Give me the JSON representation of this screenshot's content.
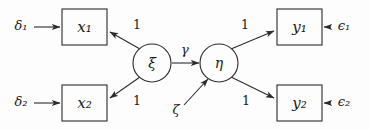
{
  "diagram": {
    "type": "structural-equation-model-path-diagram",
    "title": "",
    "background_color": "#fdfdfd",
    "stroke_color": "#2b2b2b",
    "text_color": "#1a1a1a"
  },
  "observed_variables": [
    {
      "id": "x1",
      "label": "x₁",
      "shape": "rectangle",
      "x": 62,
      "y": 9,
      "w": 45,
      "h": 36
    },
    {
      "id": "x2",
      "label": "x₂",
      "shape": "rectangle",
      "x": 62,
      "y": 85,
      "w": 45,
      "h": 36
    },
    {
      "id": "y1",
      "label": "y₁",
      "shape": "rectangle",
      "x": 277,
      "y": 9,
      "w": 45,
      "h": 36
    },
    {
      "id": "y2",
      "label": "y₂",
      "shape": "rectangle",
      "x": 277,
      "y": 85,
      "w": 45,
      "h": 36
    }
  ],
  "latent_variables": [
    {
      "id": "xi",
      "label": "ξ",
      "shape": "circle",
      "cx": 152,
      "cy": 63,
      "r": 19
    },
    {
      "id": "eta",
      "label": "η",
      "shape": "circle",
      "cx": 219,
      "cy": 63,
      "r": 19
    }
  ],
  "error_terms": [
    {
      "id": "delta1",
      "label": "δ₁",
      "x": 21,
      "y": 26
    },
    {
      "id": "delta2",
      "label": "δ₂",
      "x": 21,
      "y": 102
    },
    {
      "id": "epsilon1",
      "label": "ϵ₁",
      "x": 344,
      "y": 26
    },
    {
      "id": "epsilon2",
      "label": "ϵ₂",
      "x": 344,
      "y": 102
    },
    {
      "id": "zeta",
      "label": "ζ",
      "x": 176,
      "y": 110
    }
  ],
  "path_labels": [
    {
      "id": "loading-x1",
      "label": "1",
      "x": 137,
      "y": 25,
      "from": "xi",
      "to": "x1"
    },
    {
      "id": "loading-x2",
      "label": "1",
      "x": 137,
      "y": 101,
      "from": "xi",
      "to": "x2"
    },
    {
      "id": "loading-y1",
      "label": "1",
      "x": 245,
      "y": 25,
      "from": "eta",
      "to": "y1"
    },
    {
      "id": "loading-y2",
      "label": "1",
      "x": 246,
      "y": 101,
      "from": "eta",
      "to": "y2"
    },
    {
      "id": "structural-gamma",
      "label": "γ",
      "x": 185,
      "y": 50,
      "from": "xi",
      "to": "eta"
    }
  ],
  "edges": [
    {
      "id": "edge-delta1-x1",
      "from": "delta1",
      "to": "x1",
      "style": "straight-arrow"
    },
    {
      "id": "edge-delta2-x2",
      "from": "delta2",
      "to": "x2",
      "style": "straight-arrow"
    },
    {
      "id": "edge-xi-x1",
      "from": "xi",
      "to": "x1",
      "style": "diagonal-arrow",
      "coefficient": "1"
    },
    {
      "id": "edge-xi-x2",
      "from": "xi",
      "to": "x2",
      "style": "diagonal-arrow",
      "coefficient": "1"
    },
    {
      "id": "edge-xi-eta",
      "from": "xi",
      "to": "eta",
      "style": "straight-arrow",
      "coefficient": "γ"
    },
    {
      "id": "edge-zeta-eta",
      "from": "zeta",
      "to": "eta",
      "style": "diagonal-arrow"
    },
    {
      "id": "edge-eta-y1",
      "from": "eta",
      "to": "y1",
      "style": "diagonal-arrow",
      "coefficient": "1"
    },
    {
      "id": "edge-eta-y2",
      "from": "eta",
      "to": "y2",
      "style": "diagonal-arrow",
      "coefficient": "1"
    },
    {
      "id": "edge-epsilon1-y1",
      "from": "epsilon1",
      "to": "y1",
      "style": "straight-arrow"
    },
    {
      "id": "edge-epsilon2-y2",
      "from": "epsilon2",
      "to": "y2",
      "style": "straight-arrow"
    }
  ]
}
